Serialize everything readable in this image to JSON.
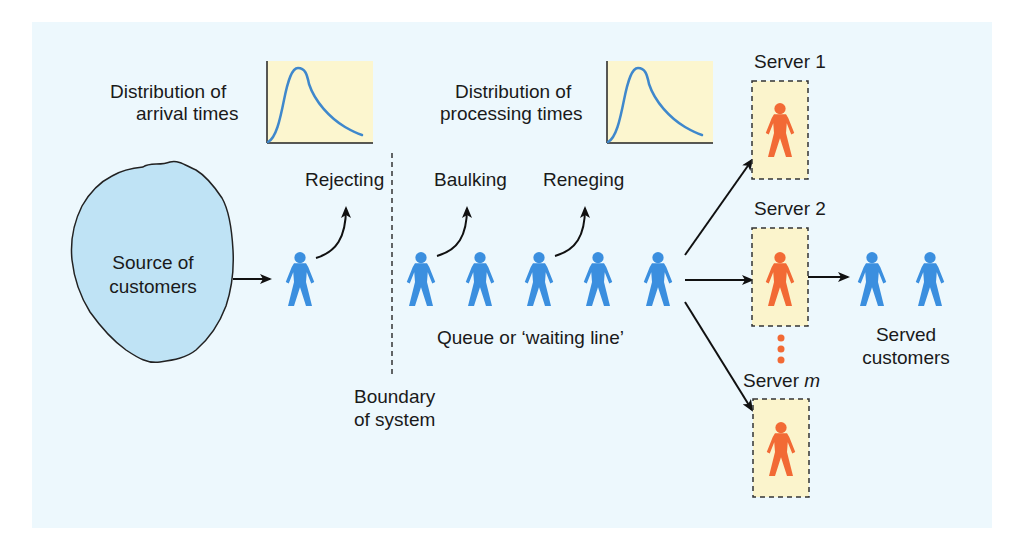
{
  "colors": {
    "page_bg": "#ffffff",
    "panel_bg": "#edf8fd",
    "source_fill": "#bfe3f5",
    "customer_blue": "#3b8fdf",
    "server_orange": "#f26a35",
    "server_box_fill": "#fbf4cc",
    "chart_box_fill": "#fcf6cf",
    "curve_blue": "#3f88cc",
    "arrow": "#111111",
    "text": "#1a1a1a"
  },
  "labels": {
    "arrival_dist_line1": "Distribution of",
    "arrival_dist_line2": "arrival times",
    "processing_dist_line1": "Distribution of",
    "processing_dist_line2": "processing times",
    "source_line1": "Source of",
    "source_line2": "customers",
    "rejecting": "Rejecting",
    "baulking": "Baulking",
    "reneging": "Reneging",
    "queue": "Queue or ‘waiting line’",
    "boundary_line1": "Boundary",
    "boundary_line2": "of system",
    "server_1": "Server 1",
    "server_2": "Server 2",
    "server_m_prefix": "Server ",
    "server_m_var": "m",
    "served_line1": "Served",
    "served_line2": "customers"
  },
  "structure": {
    "queue_customer_count": 5,
    "served_customer_count": 2,
    "server_count_shown": 3,
    "behaviours": [
      "Rejecting",
      "Baulking",
      "Reneging"
    ]
  }
}
